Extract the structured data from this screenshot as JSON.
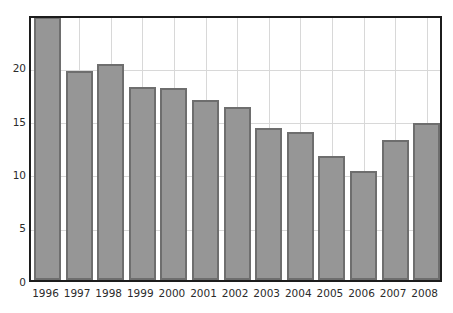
{
  "chart_data": {
    "type": "bar",
    "title": "",
    "subtitle": "",
    "xlabel": "",
    "ylabel": "",
    "categories": [
      "1996",
      "1997",
      "1998",
      "1999",
      "2000",
      "2001",
      "2002",
      "2003",
      "2004",
      "2005",
      "2006",
      "2007",
      "2008"
    ],
    "values": [
      24.8,
      19.7,
      20.4,
      18.2,
      18.1,
      17.0,
      16.3,
      14.4,
      14.0,
      11.7,
      10.3,
      13.2,
      14.8
    ],
    "series": [
      {
        "name": "",
        "values": [
          24.8,
          19.7,
          20.4,
          18.2,
          18.1,
          17.0,
          16.3,
          14.4,
          14.0,
          11.7,
          10.3,
          13.2,
          14.8
        ]
      }
    ],
    "ylim": [
      0,
      25
    ],
    "xlim": [
      0,
      13
    ],
    "yticks": [
      0,
      5,
      10,
      15,
      20
    ],
    "ytick_labels": [
      "0",
      "5",
      "10",
      "15",
      "20"
    ],
    "grid": true,
    "grid_axis": "both",
    "legend": null,
    "legend_position": "none",
    "annotations": [],
    "colors": {
      "bar_fill": "#969696",
      "bar_edge": "#6e6e6e",
      "grid": "#d8d8d8",
      "frame": "#1c1c1c",
      "background": "#ffffff",
      "tick_label": "#2b2b2b"
    }
  }
}
